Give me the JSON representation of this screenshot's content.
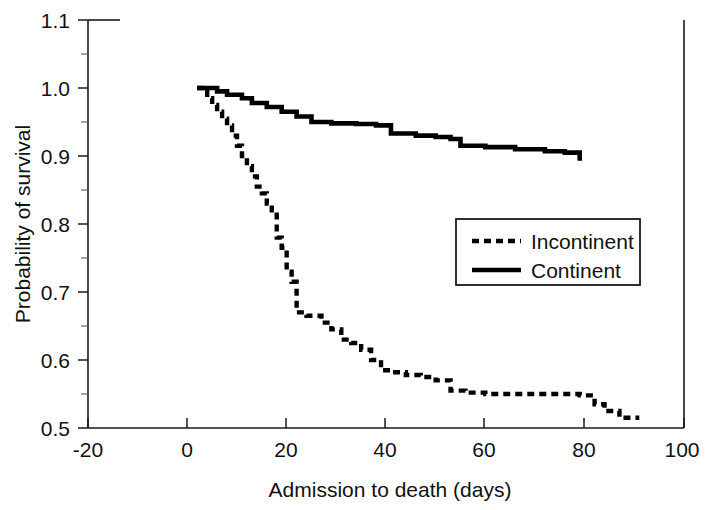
{
  "chart_data": {
    "type": "line",
    "subtype": "kaplan-meier-step",
    "title": "",
    "xlabel": "Admission to death (days)",
    "ylabel": "Probability of survival",
    "xlim": [
      -20,
      100
    ],
    "ylim": [
      0.5,
      1.1
    ],
    "xticks": [
      -20,
      0,
      20,
      40,
      60,
      80,
      100
    ],
    "xtick_labels": [
      "-20",
      "0",
      "20",
      "40",
      "60",
      "80",
      "100"
    ],
    "yticks": [
      0.5,
      0.6,
      0.7,
      0.8,
      0.9,
      1.0,
      1.1
    ],
    "ytick_labels": [
      "0.5",
      "0.6",
      "0.7",
      "0.8",
      "0.9",
      "1.0",
      "1.1"
    ],
    "yticks_minor": [
      0.55,
      0.65,
      0.75,
      0.85,
      0.95,
      1.05
    ],
    "grid": false,
    "legend_position": "center-right",
    "series": [
      {
        "name": "Incontinent",
        "style": "dotted",
        "color": "#000000",
        "x": [
          2,
          4,
          5,
          6,
          7,
          8,
          9,
          10,
          11,
          12,
          13,
          14,
          15,
          16,
          17,
          18,
          19,
          20,
          21,
          22,
          24,
          27,
          29,
          31,
          33,
          35,
          37,
          39,
          41,
          44,
          47,
          50,
          53,
          56,
          60,
          64,
          68,
          72,
          76,
          79,
          82,
          84,
          87,
          91
        ],
        "y": [
          1.0,
          0.985,
          0.975,
          0.965,
          0.955,
          0.945,
          0.93,
          0.915,
          0.9,
          0.885,
          0.87,
          0.855,
          0.845,
          0.83,
          0.82,
          0.78,
          0.765,
          0.73,
          0.715,
          0.67,
          0.665,
          0.655,
          0.645,
          0.63,
          0.625,
          0.615,
          0.6,
          0.585,
          0.582,
          0.578,
          0.575,
          0.57,
          0.555,
          0.552,
          0.55,
          0.55,
          0.55,
          0.55,
          0.55,
          0.548,
          0.535,
          0.525,
          0.515,
          0.515
        ]
      },
      {
        "name": "Continent",
        "style": "solid",
        "color": "#000000",
        "x": [
          2,
          4,
          6,
          8,
          11,
          13,
          16,
          19,
          22,
          25,
          29,
          34,
          38,
          41,
          46,
          50,
          53,
          55,
          60,
          66,
          72,
          76,
          79
        ],
        "y": [
          1.0,
          1.0,
          0.995,
          0.99,
          0.985,
          0.978,
          0.972,
          0.965,
          0.958,
          0.95,
          0.948,
          0.947,
          0.945,
          0.933,
          0.93,
          0.928,
          0.925,
          0.915,
          0.913,
          0.91,
          0.907,
          0.905,
          0.893
        ]
      }
    ]
  },
  "axes": {
    "x_title": "Admission to death (days)",
    "y_title": "Probability of survival"
  },
  "legend": {
    "entries": [
      {
        "label": "Incontinent",
        "style": "dotted"
      },
      {
        "label": "Continent",
        "style": "solid"
      }
    ]
  },
  "colors": {
    "series": "#000000",
    "axis": "#1a1a1a",
    "background": "#ffffff"
  }
}
